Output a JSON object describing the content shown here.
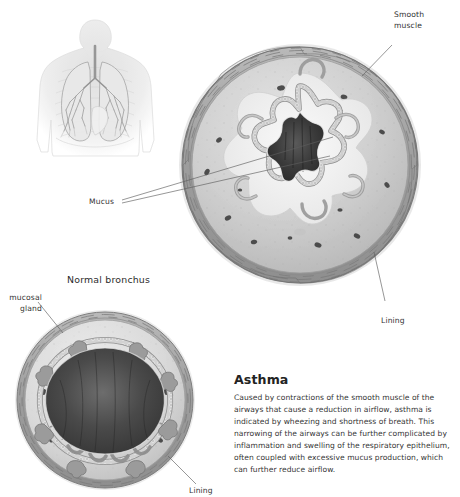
{
  "page": {
    "background_color": "#ffffff",
    "ink_color": "#333333"
  },
  "figures": {
    "torso": {
      "name": "anatomical torso with lungs and bronchial tree",
      "tint": "#c9c9c9"
    },
    "asthmatic_bronchus": {
      "name": "asthmatic bronchus cross-section",
      "lumen_state": "constricted, star-shaped"
    },
    "normal_bronchus": {
      "name": "normal bronchus cross-section",
      "lumen_state": "open, wide"
    }
  },
  "labels": {
    "smooth_muscle": "Smooth\nmuscle",
    "mucus": "Mucus",
    "lining_top": "Lining",
    "submucosal_gland": "mucosal\ngland",
    "lining_bottom": "Lining",
    "normal_bronchus_title": "Normal bronchus"
  },
  "panel": {
    "heading": "Asthma",
    "body": "Caused by contractions of the smooth muscle of the airways that cause a reduction in airflow, asthma is indicated by wheezing and shortness of breath. This narrowing of the airways can be further complicated by inflammation and swelling of the respiratory epithelium, often coupled with excessive mucus production, which can further reduce airflow."
  }
}
